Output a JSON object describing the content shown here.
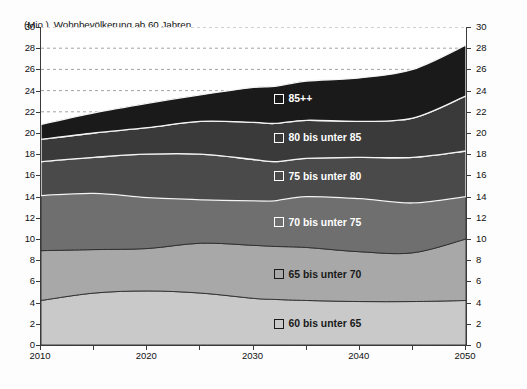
{
  "chart_data": {
    "type": "area",
    "title": "Wohnbevölkerung ab 60 Jahren",
    "unit_label": "(Mio.)",
    "xlabel": "",
    "ylabel": "",
    "xlim": [
      2010,
      2050
    ],
    "ylim": [
      0,
      30
    ],
    "ytick_step": 2,
    "xtick_step": 10,
    "x_minor_step": 5,
    "grid": "horizontal dashed above stack",
    "stacked": true,
    "legend_position": "inside right, one label per band",
    "yticks": [
      0,
      2,
      4,
      6,
      8,
      10,
      12,
      14,
      16,
      18,
      20,
      22,
      24,
      26,
      28,
      30
    ],
    "yticks_right": [
      0,
      2,
      4,
      6,
      8,
      10,
      12,
      14,
      16,
      18,
      20,
      22,
      24,
      26,
      28,
      30
    ],
    "xticks": [
      2010,
      2020,
      2030,
      2040,
      2050
    ],
    "x": [
      2010,
      2015,
      2020,
      2025,
      2030,
      2032,
      2035,
      2040,
      2045,
      2050
    ],
    "series": [
      {
        "name": "60 bis unter 65",
        "color": "#c9c9c9",
        "values": [
          4.2,
          4.9,
          5.1,
          4.9,
          4.4,
          4.3,
          4.2,
          4.1,
          4.1,
          4.2
        ]
      },
      {
        "name": "65 bis unter 70",
        "color": "#a8a8a8",
        "values": [
          4.7,
          4.1,
          4.0,
          4.7,
          5.0,
          5.0,
          5.0,
          4.7,
          4.6,
          5.8
        ]
      },
      {
        "name": "70 bis unter 75",
        "color": "#6f6f6f",
        "values": [
          5.2,
          5.3,
          4.8,
          4.1,
          4.2,
          4.3,
          4.8,
          5.0,
          4.7,
          4.0
        ]
      },
      {
        "name": "75 bis unter 80",
        "color": "#4a4a4a",
        "values": [
          3.2,
          3.4,
          4.1,
          4.3,
          3.9,
          3.7,
          3.6,
          3.9,
          4.3,
          4.3
        ]
      },
      {
        "name": "80 bis unter 85",
        "color": "#3a3a3a",
        "values": [
          2.1,
          2.3,
          2.5,
          3.1,
          3.5,
          3.6,
          3.6,
          3.4,
          3.7,
          5.2
        ]
      },
      {
        "name": "85++",
        "color": "#1a1a1a",
        "values": [
          1.4,
          1.9,
          2.3,
          2.5,
          3.3,
          3.5,
          3.7,
          4.1,
          4.6,
          4.8
        ]
      }
    ],
    "totals": [
      20.8,
      21.9,
      22.8,
      23.6,
      24.3,
      24.4,
      24.9,
      25.2,
      26.0,
      28.3
    ],
    "band_boundaries": {
      "2010": [
        4.2,
        8.9,
        14.1,
        17.3,
        19.4,
        20.8
      ],
      "2050": [
        4.2,
        10.0,
        14.0,
        18.3,
        23.5,
        28.3
      ]
    },
    "annotations": []
  },
  "legend": [
    {
      "label": "85++",
      "on": "dark"
    },
    {
      "label": "80 bis unter 85",
      "on": "dark"
    },
    {
      "label": "75 bis unter 80",
      "on": "dark"
    },
    {
      "label": "70 bis unter 75",
      "on": "dark"
    },
    {
      "label": "65 bis unter 70",
      "on": "light"
    },
    {
      "label": "60 bis unter 65",
      "on": "light"
    }
  ]
}
